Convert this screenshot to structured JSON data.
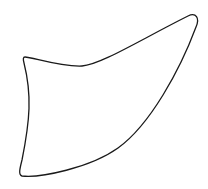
{
  "canvas": {
    "width": 208,
    "height": 189,
    "background": "#ffffff"
  },
  "shape": {
    "kind": "closed-curved-outline",
    "stroke": "#1a1a1a",
    "stroke_width": 1.3,
    "fill": "none"
  }
}
